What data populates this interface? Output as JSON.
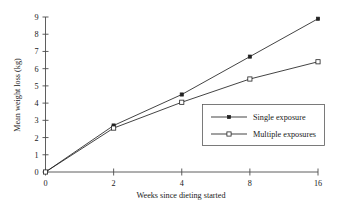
{
  "chart_data": {
    "type": "line",
    "title": "",
    "subtitle": "",
    "xlabel": "Weeks since dieting started",
    "ylabel": "Mean weight loss (kg)",
    "categories": [
      "0",
      "2",
      "4",
      "8",
      "16"
    ],
    "x_tick_labels": [
      "0",
      "2",
      "4",
      "8",
      "16"
    ],
    "y_tick_labels": [
      "0",
      "1",
      "2",
      "3",
      "4",
      "5",
      "6",
      "7",
      "8",
      "9"
    ],
    "ylim": [
      0,
      9
    ],
    "y_tick_step": 1,
    "grid": false,
    "legend_position": "center-right",
    "series": [
      {
        "name": "Single exposure",
        "marker": "filled-square",
        "values": [
          0,
          2.7,
          4.5,
          6.7,
          8.9
        ]
      },
      {
        "name": "Multiple exposures",
        "marker": "open-square",
        "values": [
          0,
          2.55,
          4.05,
          5.4,
          6.4
        ]
      }
    ],
    "colors": {
      "line": "#222222",
      "axis": "#4d4d4d",
      "text": "#1a1a1a",
      "legend_border": "#5a5a5a",
      "background": "#ffffff"
    }
  },
  "legend": {
    "items": [
      {
        "label": "Single exposure",
        "marker": "filled-square"
      },
      {
        "label": "Multiple exposures",
        "marker": "open-square"
      }
    ]
  },
  "axes": {
    "x_title": "Weeks since dieting started",
    "y_title": "Mean weight loss (kg)"
  }
}
